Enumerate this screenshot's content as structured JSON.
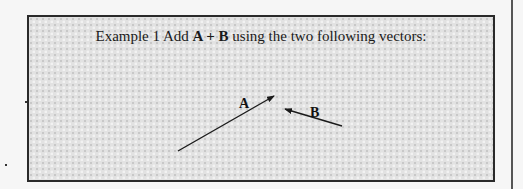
{
  "example": {
    "prefix": "Example 1  Add ",
    "expression": "A + B",
    "suffix": " using the two following vectors:"
  },
  "vectors": [
    {
      "label": "A",
      "from": [
        149,
        134
      ],
      "to": [
        245,
        79
      ],
      "color": "#1a1a1a"
    },
    {
      "label": "B",
      "from": [
        313,
        109
      ],
      "to": [
        256,
        92
      ],
      "color": "#1a1a1a"
    }
  ],
  "colors": {
    "border": "#2a2a2a",
    "ink": "#1a1a1a",
    "background": "#e2e2e2"
  }
}
